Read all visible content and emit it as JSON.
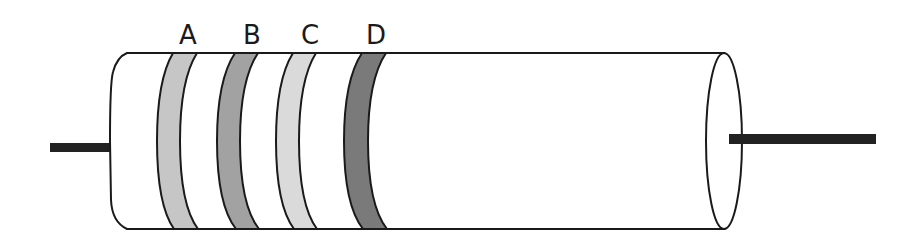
{
  "diagram": {
    "bands": [
      {
        "label": "A",
        "color": "#c6c6c6"
      },
      {
        "label": "B",
        "color": "#a2a2a2"
      },
      {
        "label": "C",
        "color": "#dadada"
      },
      {
        "label": "D",
        "color": "#7a7a7a"
      }
    ],
    "colors": {
      "outline": "#1a1a1a",
      "body": "#ffffff",
      "lead": "#222222"
    }
  }
}
